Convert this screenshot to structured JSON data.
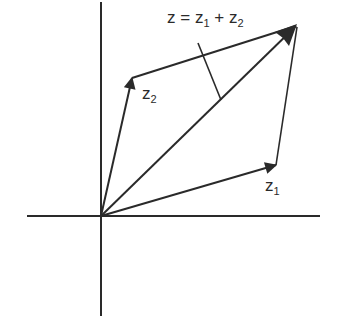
{
  "diagram": {
    "colors": {
      "ink": "#2a2a2a",
      "background": "#ffffff"
    },
    "axes": {
      "horizontal": {
        "x1": 27,
        "y1": 216,
        "x2": 320,
        "y2": 216
      },
      "vertical": {
        "x1": 101,
        "y1": 2,
        "x2": 101,
        "y2": 316
      },
      "origin": {
        "x": 101,
        "y": 216
      }
    },
    "vectors": [
      {
        "name": "z1",
        "from": [
          101,
          216
        ],
        "to": [
          276,
          165
        ],
        "arrow": true
      },
      {
        "name": "z2",
        "from": [
          101,
          216
        ],
        "to": [
          132,
          78
        ],
        "arrow": true
      },
      {
        "name": "z",
        "from": [
          101,
          216
        ],
        "to": [
          297,
          25
        ],
        "arrow": true
      }
    ],
    "parallelogram_sides": [
      {
        "name": "z2-to-sum",
        "from": [
          132,
          78
        ],
        "to": [
          297,
          25
        ],
        "arrow": true
      },
      {
        "name": "z1-to-sum",
        "from": [
          276,
          165
        ],
        "to": [
          297,
          25
        ],
        "arrow": false
      }
    ],
    "leader_line": {
      "from": [
        198,
        43
      ],
      "to": [
        221,
        100
      ]
    },
    "labels": {
      "sum": {
        "z": "z",
        "eq": " = ",
        "z1": "z",
        "sub1": "1",
        "plus": " + ",
        "z2": "z",
        "sub2": "2"
      },
      "z1": {
        "base": "z",
        "sub": "1"
      },
      "z2": {
        "base": "z",
        "sub": "2"
      }
    }
  }
}
